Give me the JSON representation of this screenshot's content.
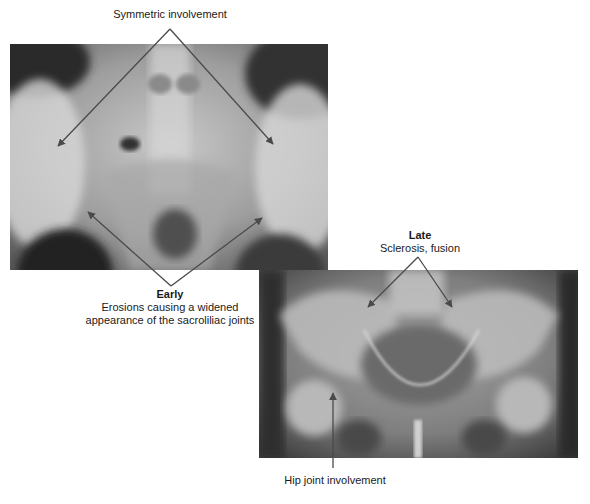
{
  "figure": {
    "panels": [
      {
        "id": "early",
        "description": "AP pelvis radiograph, sacroiliac joints, early stage"
      },
      {
        "id": "late",
        "description": "AP pelvis radiograph, sacroiliac joints and hips, late stage"
      }
    ],
    "labels": {
      "symmetric": "Symmetric involvement",
      "early_title": "Early",
      "early_line1": "Erosions causing a widened",
      "early_line2": "appearance of the sacroliliac joints",
      "late_title": "Late",
      "late_subtitle": "Sclerosis, fusion",
      "hip": "Hip joint involvement"
    },
    "colors": {
      "arrow": "#4a4a4a",
      "background": "#ffffff"
    }
  }
}
